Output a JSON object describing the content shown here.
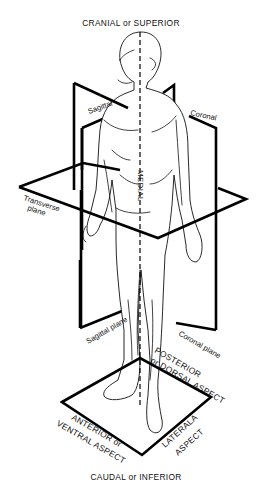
{
  "diagram": {
    "title_top": "CRANIAL or SUPERIOR",
    "title_bottom": "CAUDAL or INFERIOR",
    "planes": {
      "sagittal_top": "Sagittal",
      "coronal_top": "Coronal",
      "transverse_line1": "Transverse",
      "transverse_line2": "plane",
      "sagittal_bottom": "Sagittal plane",
      "coronal_bottom": "Coronal plane"
    },
    "midline": "MEDIAL",
    "aspects": {
      "posterior_line1": "POSTERIOR",
      "posterior_line2": "or DORSAL ASPECT",
      "anterior_line1": "ANTERIOR or",
      "anterior_line2": "VENTRAL ASPECT",
      "lateral_line1": "LATERALA",
      "lateral_line2": "ASPECT"
    }
  }
}
